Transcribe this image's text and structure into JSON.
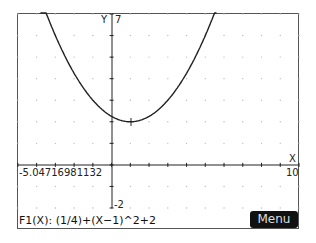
{
  "graph": {
    "y_axis_label": "Y",
    "x_axis_label": "X",
    "y_max_label": "7",
    "y_min_label": "-2",
    "x_min_label": "-5.04716981132",
    "x_max_label": "10"
  },
  "function_label": "F1(X): (1/4)+(X−1)^2+2",
  "menu_label": "Menu",
  "chart_data": {
    "type": "line",
    "title": "",
    "xlabel": "X",
    "ylabel": "Y",
    "xlim": [
      -5.04716981132,
      10
    ],
    "ylim": [
      -2,
      7
    ],
    "grid": true,
    "series": [
      {
        "name": "F1(X)",
        "expression": "(1/4)*(X-1)^2+2",
        "vertex": [
          1,
          2
        ],
        "x": [
          -3.7,
          -3,
          -2,
          -1,
          0,
          1,
          2,
          3,
          4,
          5,
          5.5
        ],
        "y": [
          7.52,
          6,
          4.25,
          3,
          2.25,
          2,
          2.25,
          3,
          4.25,
          6,
          7.06
        ]
      }
    ]
  }
}
